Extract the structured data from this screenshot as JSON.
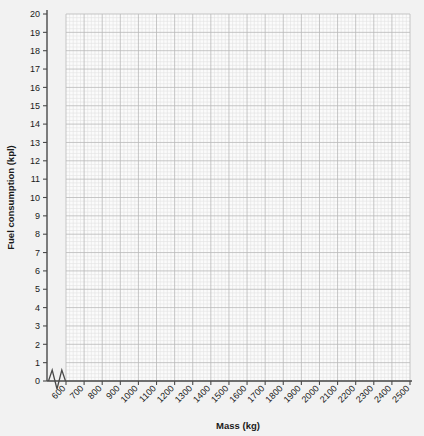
{
  "chart_data": {
    "type": "scatter",
    "title": "",
    "subtitle": "",
    "xlabel": "Mass (kg)",
    "ylabel": "Fuel consumption (kpl)",
    "xlim": [
      600,
      2500
    ],
    "ylim": [
      0,
      20
    ],
    "x_ticks": [
      600,
      700,
      800,
      900,
      1000,
      1100,
      1200,
      1300,
      1400,
      1500,
      1600,
      1700,
      1800,
      1900,
      2000,
      2100,
      2200,
      2300,
      2400,
      2500
    ],
    "y_ticks": [
      0,
      1,
      2,
      3,
      4,
      5,
      6,
      7,
      8,
      9,
      10,
      11,
      12,
      13,
      14,
      15,
      16,
      17,
      18,
      19,
      20
    ],
    "x_tick_labels": [
      "600",
      "700",
      "800",
      "900",
      "1000",
      "1100",
      "1200",
      "1300",
      "1400",
      "1500",
      "1600",
      "1700",
      "1800",
      "1900",
      "2000",
      "2100",
      "2200",
      "2300",
      "2400",
      "2500"
    ],
    "y_tick_labels": [
      "0",
      "1",
      "2",
      "3",
      "4",
      "5",
      "6",
      "7",
      "8",
      "9",
      "10",
      "11",
      "12",
      "13",
      "14",
      "15",
      "16",
      "17",
      "18",
      "19",
      "20"
    ],
    "x_tick_label_rotation": -45,
    "grid": true,
    "grid_major": true,
    "grid_minor": true,
    "minor_subdivisions": 5,
    "legend": null,
    "series": [],
    "values": [],
    "categories": [],
    "annotations": [
      {
        "name": "x-axis-break",
        "type": "axis-break-zigzag",
        "axis": "x",
        "between": [
          0,
          600
        ]
      }
    ],
    "colors": {
      "background": "#f2f2f2",
      "plot_background": "#fbfbfb",
      "grid_major": "#b9b9b9",
      "grid_minor": "#e2e2e2",
      "axis": "#4a4a4a",
      "text": "#1a1a1a"
    }
  }
}
